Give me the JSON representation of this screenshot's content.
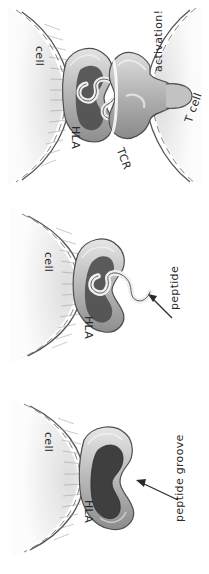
{
  "figure": {
    "orientation": "rotated-90",
    "background_color": "#ffffff",
    "ink_color": "#2a2a2a",
    "panel_count": 3
  },
  "palette": {
    "ink": "#2a2a2a",
    "cell_fill_light": "#f2f2f2",
    "cell_fill_mid": "#e2e2e2",
    "membrane_line": "#555555",
    "hla_light": "#d8d8d8",
    "hla_mid": "#aeaeae",
    "hla_dark": "#8c8c8c",
    "groove_dark": "#4a4a4a",
    "groove_darker": "#3a3a3a",
    "peptide_light": "#ededed",
    "tcr_mid": "#b4b4b4",
    "tcr_dark": "#909090"
  },
  "panels": [
    {
      "id": "panel-activation",
      "name": "tcr-engagement-panel",
      "order": 1,
      "caption": "HLA-peptide complex engaged by T cell receptor, leading to activation",
      "labels": [
        {
          "id": "cell",
          "text": "cell",
          "rotation": 90,
          "x": 46,
          "y": 46
        },
        {
          "id": "hla",
          "text": "HLA",
          "rotation": 90,
          "x": 82,
          "y": 126
        },
        {
          "id": "tcr",
          "text": "TCR",
          "rotation": 70,
          "x": 126,
          "y": 146
        },
        {
          "id": "activation",
          "text": "activation!",
          "rotation": -90,
          "x": 152,
          "y": 72
        },
        {
          "id": "tcell",
          "text": "T cell",
          "rotation": -70,
          "x": 182,
          "y": 120
        }
      ]
    },
    {
      "id": "panel-peptide",
      "name": "peptide-loaded-panel",
      "order": 2,
      "caption": "Peptide bound within the HLA groove",
      "labels": [
        {
          "id": "cell",
          "text": "cell",
          "rotation": 90,
          "x": 55,
          "y": 62
        },
        {
          "id": "hla",
          "text": "HLA",
          "rotation": 90,
          "x": 95,
          "y": 126
        },
        {
          "id": "peptide",
          "text": "peptide",
          "rotation": -90,
          "x": 168,
          "y": 120
        }
      ]
    },
    {
      "id": "panel-groove",
      "name": "empty-groove-panel",
      "order": 3,
      "caption": "Empty HLA peptide groove on the cell surface",
      "labels": [
        {
          "id": "cell",
          "text": "cell",
          "rotation": 90,
          "x": 55,
          "y": 50
        },
        {
          "id": "hla",
          "text": "HLA",
          "rotation": 90,
          "x": 95,
          "y": 118
        },
        {
          "id": "peptide_groove",
          "text": "peptide groove",
          "rotation": -90,
          "x": 173,
          "y": 140
        }
      ]
    }
  ],
  "annotations": {
    "arrow_peptide": "arrow pointing from the peptide label to the peptide ribbon",
    "arrow_groove": "arrow pointing from the peptide groove label into the dark groove"
  }
}
